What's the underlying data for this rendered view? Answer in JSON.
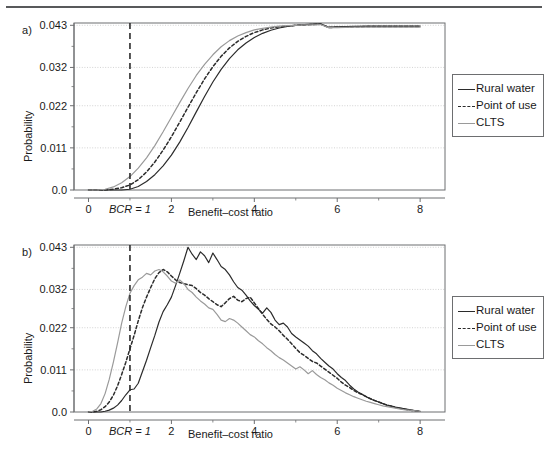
{
  "figure": {
    "panels": [
      {
        "id": "a",
        "label": "a)",
        "xlabel": "Benefit–cost ratio",
        "ylabel": "Probability"
      },
      {
        "id": "b",
        "label": "b)",
        "xlabel": "Benefit–cost ratio",
        "ylabel": "Probability"
      }
    ],
    "legend": {
      "entries": [
        {
          "label": "Rural water",
          "style": "solid",
          "color": "#2b2b2b"
        },
        {
          "label": "Point of use",
          "style": "dashed",
          "color": "#2b2b2b"
        },
        {
          "label": "CLTS",
          "style": "solid",
          "color": "#9a9a9a"
        }
      ]
    },
    "annotation": {
      "bcr_label": "BCR = 1",
      "bcr_x": 1
    },
    "colors": {
      "rural_water": "#2b2b2b",
      "point_of_use": "#2b2b2b",
      "clts": "#9a9a9a",
      "grid": "#c8c8c8",
      "axis": "#6d6e70",
      "rule": "#58595b"
    }
  },
  "chart_data": [
    {
      "type": "line",
      "panel": "a",
      "title": "a)",
      "xlabel": "Benefit–cost ratio",
      "ylabel": "Probability",
      "xlim": [
        -0.35,
        8.6
      ],
      "ylim": [
        0.0,
        0.0436
      ],
      "xticks": [
        0,
        2,
        4,
        6,
        8
      ],
      "xticklabels": [
        "0",
        "2",
        "4",
        "6",
        "8"
      ],
      "yticks": [
        0.0,
        0.011,
        0.022,
        0.032,
        0.043
      ],
      "yticklabels": [
        "0.0",
        "0.011",
        "0.022",
        "0.032",
        "0.043"
      ],
      "grid": "y-dotted",
      "legend_position": "right-outside",
      "annotations": [
        {
          "text": "BCR = 1",
          "type": "vline",
          "x": 1,
          "style": "dashed",
          "color": "#2b2b2b"
        }
      ],
      "x": [
        0.0,
        0.2,
        0.4,
        0.6,
        0.8,
        1.0,
        1.2,
        1.4,
        1.6,
        1.8,
        2.0,
        2.2,
        2.4,
        2.6,
        2.8,
        3.0,
        3.2,
        3.4,
        3.6,
        3.8,
        4.0,
        4.2,
        4.4,
        4.6,
        4.8,
        5.0,
        5.2,
        5.4,
        5.6,
        5.8,
        6.0,
        6.4,
        6.8,
        7.2,
        7.6,
        8.0
      ],
      "series": [
        {
          "name": "Rural water",
          "style": "solid",
          "color": "#2b2b2b",
          "values": [
            0.0,
            0.0,
            0.0,
            0.0,
            0.0,
            0.0002,
            0.0009,
            0.0022,
            0.004,
            0.0063,
            0.0091,
            0.0125,
            0.0163,
            0.0204,
            0.0244,
            0.0282,
            0.0315,
            0.0343,
            0.0366,
            0.0384,
            0.0398,
            0.0409,
            0.0417,
            0.0423,
            0.0427,
            0.043,
            0.0432,
            0.0433,
            0.0434,
            0.0425,
            0.0426,
            0.0427,
            0.0428,
            0.0428,
            0.0428,
            0.0428
          ]
        },
        {
          "name": "Point of use",
          "style": "dashed",
          "color": "#2b2b2b",
          "values": [
            0.0,
            0.0,
            0.0,
            0.0002,
            0.0006,
            0.0013,
            0.0027,
            0.0047,
            0.0073,
            0.0104,
            0.0139,
            0.0177,
            0.0216,
            0.0254,
            0.029,
            0.0322,
            0.0349,
            0.0371,
            0.0388,
            0.0401,
            0.0411,
            0.0418,
            0.0423,
            0.0426,
            0.0428,
            0.043,
            0.0431,
            0.0432,
            0.0433,
            0.0424,
            0.0425,
            0.0426,
            0.0427,
            0.0427,
            0.0427,
            0.0427
          ]
        },
        {
          "name": "CLTS",
          "style": "solid",
          "color": "#9a9a9a",
          "values": [
            0.0,
            0.0,
            0.0002,
            0.0008,
            0.0019,
            0.0035,
            0.0057,
            0.0084,
            0.0116,
            0.0152,
            0.019,
            0.0228,
            0.0265,
            0.0299,
            0.0328,
            0.0353,
            0.0374,
            0.039,
            0.0402,
            0.0411,
            0.0418,
            0.0422,
            0.0425,
            0.0428,
            0.0429,
            0.043,
            0.0431,
            0.0431,
            0.0432,
            0.0424,
            0.0424,
            0.0425,
            0.0425,
            0.0425,
            0.0425,
            0.0425
          ]
        }
      ]
    },
    {
      "type": "line",
      "panel": "b",
      "title": "b)",
      "xlabel": "Benefit–cost ratio",
      "ylabel": "Probability",
      "xlim": [
        -0.35,
        8.6
      ],
      "ylim": [
        0.0,
        0.0436
      ],
      "xticks": [
        0,
        2,
        4,
        6,
        8
      ],
      "xticklabels": [
        "0",
        "2",
        "4",
        "6",
        "8"
      ],
      "yticks": [
        0.0,
        0.011,
        0.022,
        0.032,
        0.043
      ],
      "yticklabels": [
        "0.0",
        "0.011",
        "0.022",
        "0.032",
        "0.043"
      ],
      "grid": "y-dotted",
      "legend_position": "right-outside",
      "annotations": [
        {
          "text": "BCR = 1",
          "type": "vline",
          "x": 1,
          "style": "dashed",
          "color": "#2b2b2b"
        }
      ],
      "x": [
        0.0,
        0.1,
        0.2,
        0.3,
        0.4,
        0.5,
        0.6,
        0.7,
        0.8,
        0.9,
        1.0,
        1.1,
        1.2,
        1.3,
        1.4,
        1.5,
        1.6,
        1.7,
        1.8,
        1.9,
        2.0,
        2.1,
        2.2,
        2.3,
        2.4,
        2.5,
        2.6,
        2.7,
        2.8,
        2.9,
        3.0,
        3.1,
        3.2,
        3.3,
        3.4,
        3.5,
        3.6,
        3.7,
        3.8,
        3.9,
        4.0,
        4.1,
        4.2,
        4.3,
        4.4,
        4.5,
        4.6,
        4.7,
        4.8,
        4.9,
        5.0,
        5.1,
        5.2,
        5.3,
        5.4,
        5.5,
        5.6,
        5.7,
        5.8,
        5.9,
        6.0,
        6.1,
        6.2,
        6.3,
        6.4,
        6.5,
        6.6,
        6.7,
        6.8,
        6.9,
        7.0,
        7.1,
        7.2,
        7.3,
        7.4,
        7.5,
        7.6,
        7.7,
        7.8,
        7.9,
        8.0
      ],
      "series": [
        {
          "name": "Rural water",
          "style": "solid",
          "color": "#2b2b2b",
          "values": [
            0.0,
            0.0,
            0.0,
            0.0,
            0.0002,
            0.0005,
            0.001,
            0.0018,
            0.003,
            0.0045,
            0.0058,
            0.006,
            0.0075,
            0.0105,
            0.0135,
            0.0168,
            0.02,
            0.0235,
            0.0262,
            0.028,
            0.03,
            0.033,
            0.0362,
            0.0395,
            0.043,
            0.0412,
            0.0398,
            0.0418,
            0.0408,
            0.039,
            0.0415,
            0.0398,
            0.038,
            0.0372,
            0.0358,
            0.034,
            0.0325,
            0.0318,
            0.0305,
            0.029,
            0.0278,
            0.0268,
            0.0258,
            0.0272,
            0.026,
            0.024,
            0.0228,
            0.0232,
            0.0222,
            0.0205,
            0.0196,
            0.0188,
            0.018,
            0.0172,
            0.016,
            0.0152,
            0.014,
            0.013,
            0.012,
            0.0112,
            0.01,
            0.009,
            0.0082,
            0.007,
            0.006,
            0.0052,
            0.0046,
            0.004,
            0.0034,
            0.003,
            0.0026,
            0.0022,
            0.0018,
            0.0016,
            0.0013,
            0.0011,
            0.0009,
            0.0007,
            0.0005,
            0.0003,
            0.0002
          ]
        },
        {
          "name": "Point of use",
          "style": "dashed",
          "color": "#2b2b2b",
          "values": [
            0.0,
            0.0,
            0.0002,
            0.0006,
            0.0014,
            0.0026,
            0.0044,
            0.0068,
            0.0098,
            0.013,
            0.0165,
            0.02,
            0.0238,
            0.0272,
            0.03,
            0.0325,
            0.0348,
            0.0364,
            0.0372,
            0.0366,
            0.0355,
            0.0345,
            0.0338,
            0.0335,
            0.0332,
            0.033,
            0.0322,
            0.0312,
            0.0305,
            0.0296,
            0.0288,
            0.028,
            0.0275,
            0.0285,
            0.0296,
            0.0302,
            0.0292,
            0.0288,
            0.0296,
            0.03,
            0.0285,
            0.027,
            0.0255,
            0.0242,
            0.023,
            0.0222,
            0.0212,
            0.02,
            0.019,
            0.0178,
            0.0166,
            0.0155,
            0.0148,
            0.014,
            0.0132,
            0.0128,
            0.012,
            0.0112,
            0.0104,
            0.0096,
            0.0088,
            0.0078,
            0.007,
            0.0064,
            0.0056,
            0.005,
            0.0046,
            0.004,
            0.0035,
            0.003,
            0.0026,
            0.0022,
            0.0018,
            0.0015,
            0.0012,
            0.001,
            0.0008,
            0.0006,
            0.0004,
            0.0003,
            0.0002
          ]
        },
        {
          "name": "CLTS",
          "style": "solid",
          "color": "#9a9a9a",
          "values": [
            0.0,
            0.0002,
            0.0008,
            0.0022,
            0.0048,
            0.0085,
            0.013,
            0.018,
            0.0232,
            0.0275,
            0.031,
            0.033,
            0.0345,
            0.0352,
            0.0362,
            0.0358,
            0.0368,
            0.0372,
            0.0366,
            0.0355,
            0.0342,
            0.0336,
            0.0345,
            0.0335,
            0.032,
            0.0312,
            0.03,
            0.029,
            0.0282,
            0.0272,
            0.0268,
            0.0255,
            0.024,
            0.0236,
            0.0244,
            0.024,
            0.0232,
            0.0222,
            0.0212,
            0.0202,
            0.0196,
            0.0186,
            0.0178,
            0.0168,
            0.016,
            0.015,
            0.0142,
            0.0136,
            0.0128,
            0.012,
            0.0112,
            0.0118,
            0.011,
            0.01,
            0.0108,
            0.0098,
            0.009,
            0.0084,
            0.0076,
            0.007,
            0.0062,
            0.0056,
            0.005,
            0.0045,
            0.004,
            0.0036,
            0.0032,
            0.0028,
            0.0025,
            0.0022,
            0.0019,
            0.0016,
            0.0014,
            0.0012,
            0.001,
            0.0008,
            0.0006,
            0.0005,
            0.0004,
            0.0003,
            0.0002
          ]
        }
      ]
    }
  ]
}
